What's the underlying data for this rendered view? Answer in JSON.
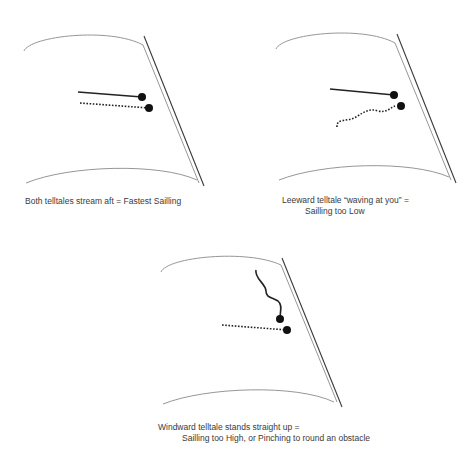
{
  "colors": {
    "sail_edge": "#8a8a8a",
    "mast_line": "#3a3a3a",
    "telltale": "#111111",
    "text": "#3a3a3a"
  },
  "panels": [
    {
      "id": "fastest",
      "caption_line1": "Both telltales stream aft = Fastest Sailling",
      "caption_line2": "",
      "windward_telltale": "streaming aft (straight solid line)",
      "leeward_telltale": "streaming aft (straight dotted line)"
    },
    {
      "id": "too-low",
      "caption_line1": "Leeward telltale “waving at you” =",
      "caption_line2": "Sailling too Low",
      "windward_telltale": "streaming aft (straight solid line)",
      "leeward_telltale": "wavy dotted line"
    },
    {
      "id": "too-high",
      "caption_line1": "Windward telltale stands straight up =",
      "caption_line2": "Sailling too High, or Pinching to round an obstacle",
      "windward_telltale": "standing up (wavy solid line)",
      "leeward_telltale": "streaming aft (straight dotted line)"
    }
  ]
}
